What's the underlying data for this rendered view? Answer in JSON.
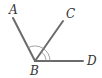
{
  "diagram": {
    "type": "geometry-angles",
    "vertex": {
      "label": "B",
      "x": 35,
      "y": 61
    },
    "points": [
      {
        "label": "A",
        "x": 13,
        "y": 18
      },
      {
        "label": "C",
        "x": 63,
        "y": 21
      },
      {
        "label": "D",
        "x": 83,
        "y": 61
      }
    ],
    "rays": [
      "BA",
      "BC",
      "BD"
    ],
    "angle_marks": [
      "∠ABD",
      "∠CBD"
    ],
    "colors": {
      "ray": "#6b6b6b",
      "arc": "#8a8a8a",
      "label": "#333333"
    }
  },
  "labels": {
    "a": "A",
    "b": "B",
    "c": "C",
    "d": "D"
  }
}
